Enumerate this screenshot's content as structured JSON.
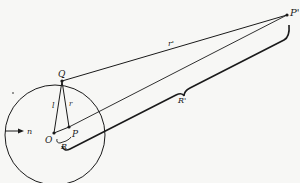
{
  "figure": {
    "colors": {
      "ink": "#1a1a1a",
      "background": "#f7f7f5"
    },
    "labels": {
      "P_far": "P'",
      "Q": "Q",
      "r_prime": "r'",
      "R_prime": "R'",
      "l": "l",
      "r": "r",
      "P_inner": "P",
      "O": "O",
      "R": "R",
      "n": "n"
    },
    "points": {
      "O": [
        54,
        133
      ],
      "P_inner": [
        69,
        127
      ],
      "Q": [
        62,
        81
      ],
      "P_far": [
        287,
        15
      ]
    },
    "circle": {
      "center": [
        55,
        135
      ],
      "radius": 50
    }
  }
}
